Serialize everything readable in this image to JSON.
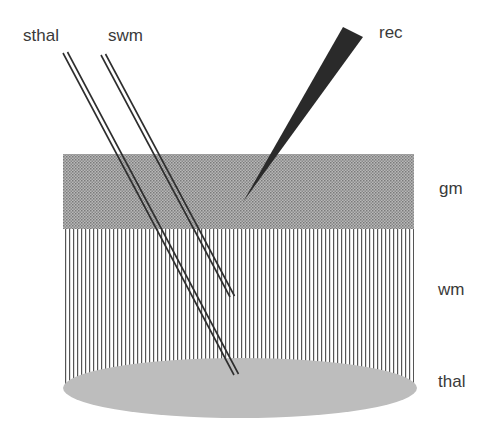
{
  "diagram": {
    "labels": {
      "sthal": "sthal",
      "swm": "swm",
      "rec": "rec",
      "gm": "gm",
      "wm": "wm",
      "thal": "thal"
    },
    "layers": [
      {
        "id": "gm",
        "name": "gray matter",
        "pattern": "checker-stipple",
        "color": "#9a9a9a"
      },
      {
        "id": "wm",
        "name": "white matter",
        "pattern": "vertical-lines",
        "color": "#555555"
      },
      {
        "id": "thal",
        "name": "thalamus",
        "shape": "ellipse",
        "color": "#bdbdbd"
      }
    ],
    "electrodes": [
      {
        "id": "sthal",
        "type": "stimulating",
        "target": "thal",
        "style": "double-line"
      },
      {
        "id": "swm",
        "type": "stimulating",
        "target": "wm",
        "style": "double-line"
      },
      {
        "id": "rec",
        "type": "recording",
        "target": "gm",
        "style": "filled-wedge",
        "color": "#2a2a2a"
      }
    ]
  }
}
